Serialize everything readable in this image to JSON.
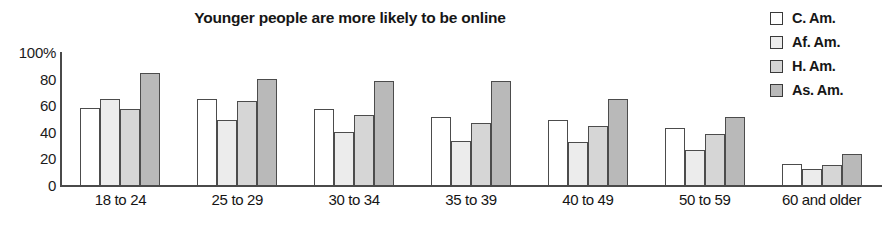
{
  "chart_data": {
    "type": "bar",
    "title": "Younger people are more likely to be online",
    "xlabel": "",
    "ylabel": "",
    "ylim": [
      0,
      100
    ],
    "yticks": [
      "100%",
      "80",
      "60",
      "40",
      "20",
      "0"
    ],
    "ytick_values": [
      100,
      80,
      60,
      40,
      20,
      0
    ],
    "grid": false,
    "legend_position": "right",
    "categories": [
      "18 to 24",
      "25 to 29",
      "30 to 34",
      "35 to 39",
      "40 to 49",
      "50 to 59",
      "60 and older"
    ],
    "series": [
      {
        "name": "C. Am.",
        "color": "#ffffff",
        "values": [
          58,
          65,
          57,
          51,
          49,
          43,
          16
        ]
      },
      {
        "name": "Af. Am.",
        "color": "#ececec",
        "values": [
          65,
          49,
          40,
          33,
          32,
          26,
          12
        ]
      },
      {
        "name": "H. Am.",
        "color": "#d6d6d6",
        "values": [
          57,
          63,
          53,
          47,
          44,
          38,
          15
        ]
      },
      {
        "name": "As. Am.",
        "color": "#b9b9b9",
        "values": [
          84,
          80,
          78,
          78,
          65,
          51,
          23
        ]
      }
    ]
  },
  "legend": {
    "items": [
      {
        "label": "C. Am."
      },
      {
        "label": "Af. Am."
      },
      {
        "label": "H. Am."
      },
      {
        "label": "As. Am."
      }
    ]
  }
}
